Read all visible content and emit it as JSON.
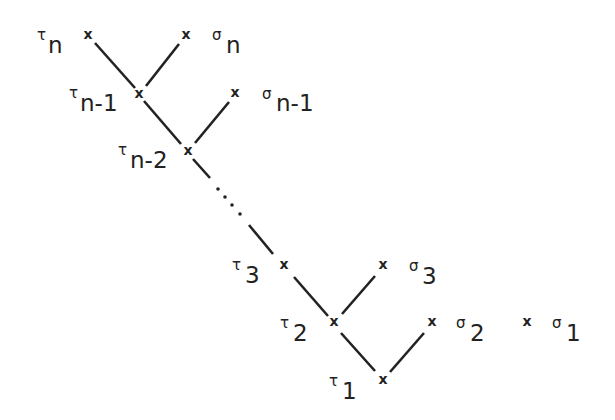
{
  "diagram": {
    "type": "binary-tree",
    "line_color": "#222222",
    "nodes": [
      {
        "id": "tau_n",
        "symbol": "τ",
        "subscript": "n",
        "x": 88,
        "y": 35
      },
      {
        "id": "sigma_n",
        "symbol": "σ",
        "subscript": "n",
        "x": 186,
        "y": 35
      },
      {
        "id": "tau_n-1",
        "symbol": "τ",
        "subscript": "n-1",
        "x": 138,
        "y": 93
      },
      {
        "id": "sigma_n-1",
        "symbol": "σ",
        "subscript": "n-1",
        "x": 235,
        "y": 93
      },
      {
        "id": "tau_n-2",
        "symbol": "τ",
        "subscript": "n-2",
        "x": 187,
        "y": 150
      },
      {
        "id": "tau_3",
        "symbol": "τ",
        "subscript": "3",
        "x": 284,
        "y": 265
      },
      {
        "id": "sigma_3",
        "symbol": "σ",
        "subscript": "3",
        "x": 383,
        "y": 265
      },
      {
        "id": "tau_2",
        "symbol": "τ",
        "subscript": "2",
        "x": 333,
        "y": 322
      },
      {
        "id": "sigma_2",
        "symbol": "σ",
        "subscript": "2",
        "x": 432,
        "y": 322
      },
      {
        "id": "tau_1",
        "symbol": "τ",
        "subscript": "1",
        "x": 382,
        "y": 379
      },
      {
        "id": "sigma_1",
        "symbol": "σ",
        "subscript": "1",
        "x": 527,
        "y": 322
      }
    ],
    "edges": [
      [
        "tau_n",
        "tau_n-1"
      ],
      [
        "sigma_n",
        "tau_n-1"
      ],
      [
        "tau_n-1",
        "tau_n-2"
      ],
      [
        "sigma_n-1",
        "tau_n-2"
      ],
      [
        "tau_n-2",
        "tau_3",
        "dotted-middle"
      ],
      [
        "tau_3",
        "tau_2"
      ],
      [
        "sigma_3",
        "tau_2"
      ],
      [
        "tau_2",
        "tau_1"
      ],
      [
        "sigma_2",
        "tau_1"
      ]
    ],
    "mark_glyph": "x",
    "ellipsis": "· · · ·",
    "labels": {
      "tau_n": {
        "greek": "τ",
        "sub": "n"
      },
      "sigma_n": {
        "greek": "σ",
        "sub": "n"
      },
      "tau_n1": {
        "greek": "τ",
        "sub": "n-1"
      },
      "sigma_n1": {
        "greek": "σ",
        "sub": "n-1"
      },
      "tau_n2": {
        "greek": "τ",
        "sub": "n-2"
      },
      "tau_3": {
        "greek": "τ",
        "sub": "3"
      },
      "sigma_3": {
        "greek": "σ",
        "sub": "3"
      },
      "tau_2": {
        "greek": "τ",
        "sub": "2"
      },
      "sigma_2": {
        "greek": "σ",
        "sub": "2"
      },
      "tau_1": {
        "greek": "τ",
        "sub": "1"
      },
      "sigma_1": {
        "greek": "σ",
        "sub": "1"
      }
    }
  }
}
